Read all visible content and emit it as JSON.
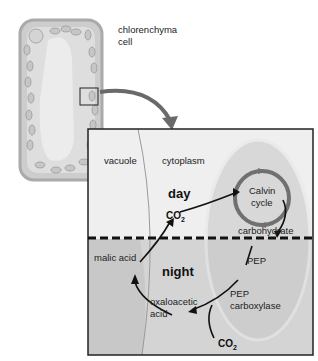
{
  "figure": {
    "cell_label_line1": "chlorenchyma",
    "cell_label_line2": "cell",
    "inset": {
      "vacuole_label": "vacuole",
      "cytoplasm_label": "cytoplasm",
      "day_label": "day",
      "night_label": "night",
      "calvin_line1": "Calvin",
      "calvin_line2": "cycle",
      "carbohydrate_label": "carbohydrate",
      "pep_label": "PEP",
      "pep_carboxylase_line1": "PEP",
      "pep_carboxylase_line2": "carboxylase",
      "oxaloacetic_line1": "oxaloacetic",
      "oxaloacetic_line2": "acid",
      "malic_acid_label": "malic acid",
      "co2_day": {
        "base": "CO",
        "sub": "2"
      },
      "co2_night": {
        "base": "CO",
        "sub": "2"
      }
    },
    "colors": {
      "cell_wall": "#b8b8b8",
      "cell_interior": "#e2e2e2",
      "chloroplast": "#c9c9c9",
      "inset_bg_day": "#efefef",
      "inset_bg_night": "#d6d6d6",
      "vacuole_night": "#cfcfcf",
      "chloroplast_region": "#c4c4c4",
      "calvin_ring": "#6f6f6f",
      "arrow_big": "#6a6a6a"
    }
  }
}
